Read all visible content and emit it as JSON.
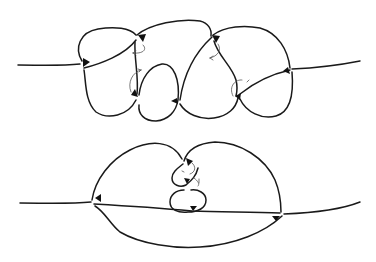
{
  "diagram": {
    "type": "knot-diagram",
    "figures": [
      {
        "id": "top",
        "description": "Chain of four overlapping loops on a horizontal strand with oriented crossings",
        "crossing_markers": 6,
        "rotation_hints": 4
      },
      {
        "id": "bottom",
        "description": "Simplified form: large loop over horizontal strand with small twisted loops in the middle",
        "crossing_markers": 4,
        "rotation_hints": 2
      }
    ],
    "colors": {
      "stroke": "#1a1a1a",
      "background": "#ffffff"
    }
  }
}
